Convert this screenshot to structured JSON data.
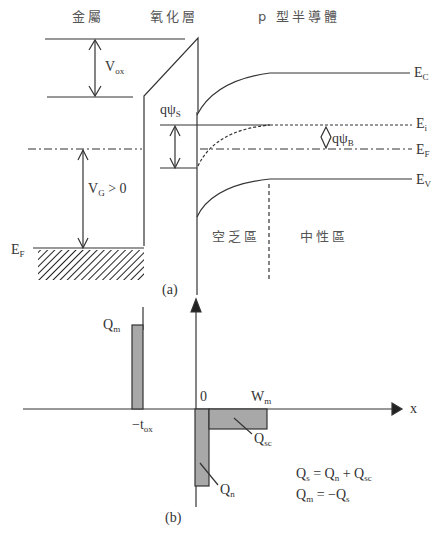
{
  "figure_a": {
    "caption": "(a)",
    "region_titles": {
      "metal": "金屬",
      "oxide": "氧化層",
      "semiconductor": "p 型半導體"
    },
    "band_labels": {
      "Ec": "E",
      "Ec_sub": "C",
      "Ei": "E",
      "Ei_sub": "i",
      "EF": "E",
      "EF_sub": "F",
      "Ev": "E",
      "Ev_sub": "V",
      "EF_metal": "E",
      "EF_metal_sub": "F"
    },
    "voltage_labels": {
      "vox": "V",
      "vox_sub": "ox",
      "vg": "V",
      "vg_sub": "G",
      "vg_rest": " > 0",
      "qpsis": "qψ",
      "qpsis_sub": "S",
      "qpsib": "qψ",
      "qpsib_sub": "B"
    },
    "zone_labels": {
      "depletion": "空乏區",
      "neutral": "中性區"
    }
  },
  "figure_b": {
    "caption": "(b)",
    "labels": {
      "qm": "Q",
      "qm_sub": "m",
      "zero": "0",
      "wm": "W",
      "wm_sub": "m",
      "x": "x",
      "tox": "−t",
      "tox_sub": "ox",
      "qsc": "Q",
      "qsc_sub": "sc",
      "qn": "Q",
      "qn_sub": "n"
    },
    "equations": [
      "Qs = Qn + Qsc",
      "Qm = −Qs"
    ],
    "eq1": {
      "a": "Q",
      "a_sub": "s",
      "b": " = Q",
      "b_sub": "n",
      "c": " + Q",
      "c_sub": "sc"
    },
    "eq2": {
      "a": "Q",
      "a_sub": "m",
      "b": " = −Q",
      "b_sub": "s"
    }
  },
  "colors": {
    "line": "#333333",
    "fill": "#a8a8a8"
  }
}
